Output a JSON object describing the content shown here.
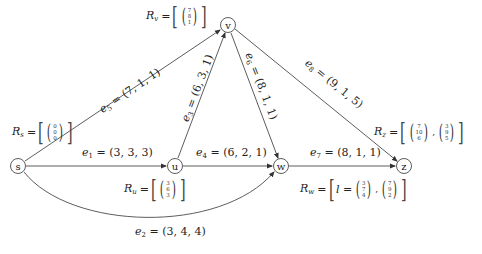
{
  "nodes": {
    "s": {
      "label": "s",
      "x": 18,
      "y": 166
    },
    "u": {
      "label": "u",
      "x": 175,
      "y": 166
    },
    "v": {
      "label": "v",
      "x": 228,
      "y": 25
    },
    "w": {
      "label": "w",
      "x": 281,
      "y": 166
    },
    "z": {
      "label": "z",
      "x": 404,
      "y": 166
    }
  },
  "edges": {
    "e1": {
      "name": "e",
      "index": "1",
      "value": "= (3, 3, 3)",
      "from": "s",
      "to": "u"
    },
    "e2": {
      "name": "e",
      "index": "2",
      "value": "= (3, 4, 4)",
      "from": "s",
      "to": "w"
    },
    "e3": {
      "name": "e",
      "index": "3",
      "value": "= (6, 3, 1)",
      "from": "u",
      "to": "v"
    },
    "e4": {
      "name": "e",
      "index": "4",
      "value": "= (6, 2, 1)",
      "from": "u",
      "to": "w"
    },
    "e5": {
      "name": "e",
      "index": "5",
      "value": "= (7, 1, 1)",
      "from": "s",
      "to": "v"
    },
    "e6": {
      "name": "e",
      "index": "6",
      "value": "= (8, 1, 1)",
      "from": "v",
      "to": "w"
    },
    "e7": {
      "name": "e",
      "index": "7",
      "value": "= (8, 1, 1)",
      "from": "w",
      "to": "z"
    },
    "e8": {
      "name": "e",
      "index": "8",
      "value": "= (9, 1, 5)",
      "from": "v",
      "to": "z"
    }
  },
  "labels": {
    "Rv": {
      "name": "R",
      "sub": "v",
      "eq": "=",
      "vectors": [
        [
          "7",
          "8",
          "1"
        ]
      ]
    },
    "Rs": {
      "name": "R",
      "sub": "s",
      "eq": "=",
      "vectors": [
        [
          "0",
          "0",
          "0"
        ]
      ]
    },
    "Ru": {
      "name": "R",
      "sub": "u",
      "eq": "=",
      "vectors": [
        [
          "3",
          "6",
          "3"
        ]
      ]
    },
    "Rw": {
      "name": "R",
      "sub": "w",
      "eq": "=",
      "prefix": "l =",
      "vectors": [
        [
          "3",
          "7",
          "4"
        ],
        [
          "7",
          "9",
          "2"
        ]
      ]
    },
    "Rz": {
      "name": "R",
      "sub": "z",
      "eq": "=",
      "vectors": [
        [
          "7",
          "10",
          "6"
        ],
        [
          "3",
          "9",
          "5"
        ]
      ]
    }
  },
  "colors": {
    "line": "#333333",
    "text": "#222222",
    "background": "#ffffff"
  }
}
